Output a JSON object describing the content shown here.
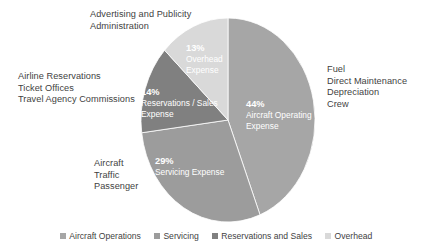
{
  "chart_data": {
    "type": "pie",
    "title": "",
    "categories": [
      "Aircraft Operations",
      "Servicing",
      "Reservations and Sales",
      "Overhead"
    ],
    "values": [
      44,
      29,
      14,
      13
    ],
    "unit": "%",
    "start_angle_deg": 0,
    "direction": "clockwise",
    "legend_position": "bottom",
    "grid": false,
    "colors": [
      "#a6a6a6",
      "#9c9c9c",
      "#808080",
      "#d9d9d9"
    ],
    "slices": [
      {
        "name": "Aircraft Operations",
        "percent_label": "44%",
        "inner_label_line1": "Aircraft Operating",
        "inner_label_line2": "Expense",
        "value": 44,
        "color": "#a6a6a6"
      },
      {
        "name": "Servicing",
        "percent_label": "29%",
        "inner_label_line1": "Servicing Expense",
        "inner_label_line2": "",
        "value": 29,
        "color": "#9c9c9c"
      },
      {
        "name": "Reservations and Sales",
        "percent_label": "14%",
        "inner_label_line1": "Reservations / Sales",
        "inner_label_line2": "Expense",
        "value": 14,
        "color": "#808080"
      },
      {
        "name": "Overhead",
        "percent_label": "13%",
        "inner_label_line1": "Overhead",
        "inner_label_line2": "Expense",
        "value": 13,
        "color": "#d9d9d9"
      }
    ],
    "annotations": [
      {
        "id": "overhead",
        "position": "top-left",
        "lines": [
          "Advertising and Publicity",
          "Administration"
        ]
      },
      {
        "id": "reservations",
        "position": "left",
        "lines": [
          "Airline Reservations",
          "Ticket Offices",
          "Travel Agency Commissions"
        ]
      },
      {
        "id": "servicing",
        "position": "bottom-left",
        "lines": [
          "Aircraft",
          "Traffic",
          "Passenger"
        ]
      },
      {
        "id": "aircraft",
        "position": "right",
        "lines": [
          "Fuel",
          "Direct Maintenance",
          "Depreciation",
          "Crew"
        ]
      }
    ],
    "legend": [
      {
        "label": "Aircraft Operations",
        "color": "#a6a6a6"
      },
      {
        "label": "Servicing",
        "color": "#9c9c9c"
      },
      {
        "label": "Reservations and Sales",
        "color": "#808080"
      },
      {
        "label": "Overhead",
        "color": "#d9d9d9"
      }
    ]
  },
  "annotation_overhead": {
    "line1": "Advertising and Publicity",
    "line2": "Administration"
  },
  "annotation_reservations": {
    "line1": "Airline Reservations",
    "line2": "Ticket Offices",
    "line3": "Travel Agency Commissions"
  },
  "annotation_servicing": {
    "line1": "Aircraft",
    "line2": "Traffic",
    "line3": "Passenger"
  },
  "annotation_aircraft": {
    "line1": "Fuel",
    "line2": "Direct Maintenance",
    "line3": "Depreciation",
    "line4": "Crew"
  }
}
